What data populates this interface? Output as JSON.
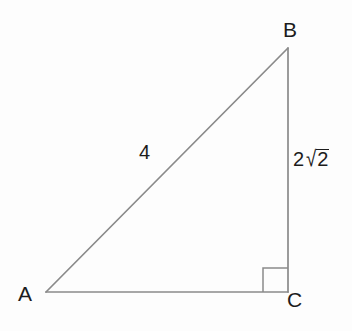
{
  "figure": {
    "name": "right-triangle-abc",
    "background_color": "#fdfdfd",
    "stroke_color": "#8a8a8a",
    "label_color": "#1c1c1c",
    "vertices": {
      "A": {
        "label": "A",
        "x": 46,
        "y": 292
      },
      "B": {
        "label": "B",
        "x": 288,
        "y": 48
      },
      "C": {
        "label": "C",
        "x": 288,
        "y": 292
      }
    },
    "sides": {
      "hypotenuse": {
        "label": "4",
        "from": "A",
        "to": "B"
      },
      "vertical_leg": {
        "label": "2√2",
        "coefficient": "2",
        "radical_sign": "√",
        "radicand": "2",
        "from": "B",
        "to": "C"
      },
      "horizontal_leg": {
        "label": "",
        "from": "A",
        "to": "C"
      }
    },
    "right_angle": {
      "at_vertex": "C",
      "marker": "square",
      "size": 25
    }
  }
}
